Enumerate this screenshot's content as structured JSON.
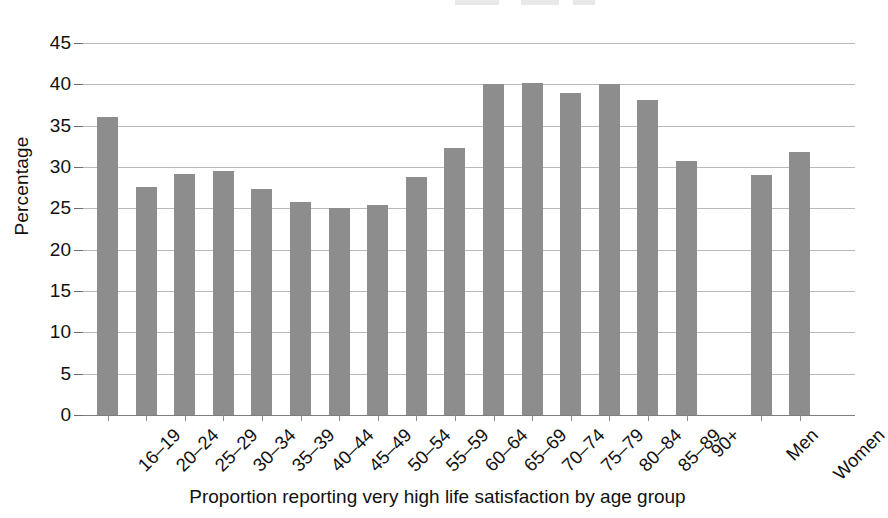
{
  "chart_data": {
    "type": "bar",
    "title": "",
    "xlabel": "Proportion reporting very high life satisfaction by age group",
    "ylabel": "Percentage",
    "ylim": [
      0,
      45
    ],
    "ytick_step": 5,
    "yticks": [
      "0",
      "5",
      "10",
      "15",
      "20",
      "25",
      "30",
      "35",
      "40",
      "45"
    ],
    "grid": true,
    "legend": "none",
    "bar_color": "#8d8d8d",
    "categories": [
      "16–19",
      "20–24",
      "25–29",
      "30–34",
      "35–39",
      "40–44",
      "45–49",
      "50–54",
      "55–59",
      "60–64",
      "65–69",
      "70–74",
      "75–79",
      "80–84",
      "85–89",
      "90+",
      "Men",
      "Women"
    ],
    "values": [
      36.0,
      27.6,
      29.1,
      29.5,
      27.3,
      25.8,
      25.1,
      25.4,
      28.8,
      32.3,
      40.1,
      40.2,
      38.9,
      40.1,
      38.1,
      30.7,
      29.0,
      31.8
    ],
    "group_break_after_index": 15
  },
  "axes": {
    "y_title": "Percentage",
    "x_title": "Proportion reporting very high life satisfaction by age group"
  }
}
